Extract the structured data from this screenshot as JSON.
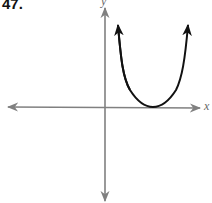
{
  "problem": {
    "number": "47."
  },
  "axes": {
    "x_label": "x",
    "y_label": "y",
    "axis_color": "#808080"
  },
  "curve": {
    "type": "parabola-like (U-shaped)",
    "vertex_on_x_axis": true,
    "vertex_position": "positive x",
    "opens": "up",
    "ends": "arrows",
    "color": "#111111"
  }
}
